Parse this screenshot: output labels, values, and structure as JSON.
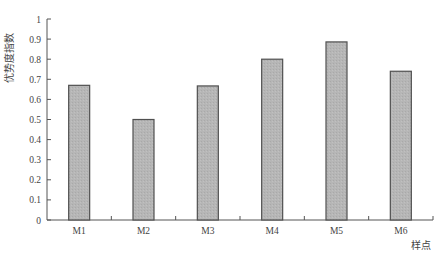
{
  "chart_data": {
    "type": "bar",
    "title": "",
    "xlabel": "样点",
    "ylabel": "优势度指数",
    "categories": [
      "M1",
      "M2",
      "M3",
      "M4",
      "M5",
      "M6"
    ],
    "values": [
      0.67,
      0.5,
      0.667,
      0.8,
      0.886,
      0.74
    ],
    "ylim": [
      0,
      1
    ],
    "yticks": [
      "0",
      "0.1",
      "0.2",
      "0.3",
      "0.4",
      "0.5",
      "0.6",
      "0.7",
      "0.8",
      "0.9",
      "1"
    ],
    "grid": false,
    "legend": null,
    "colors": {
      "bar_fill": "#b4b4b4",
      "bar_stroke": "#505050",
      "axis": "#555555"
    }
  }
}
